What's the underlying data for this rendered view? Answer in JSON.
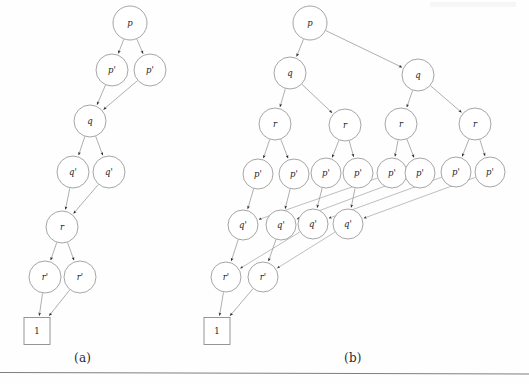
{
  "figure": {
    "background_color": "#fefefe",
    "node_stroke_color": "#8e8e8e",
    "edge_color": "#8c8c8c",
    "text_color": "#1d1d1d",
    "captions": [
      {
        "id": "a",
        "label": "(a)",
        "x": 74,
        "y": 351
      },
      {
        "id": "b",
        "label": "(b)",
        "x": 344,
        "y": 351
      }
    ],
    "separator_rule": {
      "x1": 0,
      "y1": 372,
      "x2": 529,
      "y2": 374
    }
  },
  "graph_a": {
    "name": "diagram-a",
    "nodes": [
      {
        "id": "a-p",
        "label": "p",
        "shape": "circle",
        "cx": 130,
        "cy": 23,
        "r": 17
      },
      {
        "id": "a-p1",
        "label": "p'",
        "shape": "circle",
        "cx": 112,
        "cy": 70,
        "r": 16
      },
      {
        "id": "a-p2",
        "label": "p'",
        "shape": "circle",
        "cx": 150,
        "cy": 70,
        "r": 16
      },
      {
        "id": "a-q",
        "label": "q",
        "shape": "circle",
        "cx": 90,
        "cy": 121,
        "r": 16
      },
      {
        "id": "a-q1",
        "label": "q'",
        "shape": "circle",
        "cx": 73,
        "cy": 172,
        "r": 16
      },
      {
        "id": "a-q2",
        "label": "q'",
        "shape": "circle",
        "cx": 109,
        "cy": 172,
        "r": 16
      },
      {
        "id": "a-r",
        "label": "r",
        "shape": "circle",
        "cx": 62,
        "cy": 227,
        "r": 16
      },
      {
        "id": "a-r1",
        "label": "r'",
        "shape": "circle",
        "cx": 45,
        "cy": 277,
        "r": 16
      },
      {
        "id": "a-r2",
        "label": "r'",
        "shape": "circle",
        "cx": 80,
        "cy": 277,
        "r": 16
      },
      {
        "id": "a-one",
        "label": "1",
        "shape": "box",
        "cx": 37,
        "cy": 331,
        "w": 26,
        "h": 27
      }
    ],
    "edges": [
      {
        "from": "a-p",
        "to": "a-p1"
      },
      {
        "from": "a-p",
        "to": "a-p2"
      },
      {
        "from": "a-p1",
        "to": "a-q"
      },
      {
        "from": "a-p2",
        "to": "a-q"
      },
      {
        "from": "a-q",
        "to": "a-q1"
      },
      {
        "from": "a-q",
        "to": "a-q2"
      },
      {
        "from": "a-q1",
        "to": "a-r"
      },
      {
        "from": "a-q2",
        "to": "a-r"
      },
      {
        "from": "a-r",
        "to": "a-r1"
      },
      {
        "from": "a-r",
        "to": "a-r2"
      },
      {
        "from": "a-r1",
        "to": "a-one"
      },
      {
        "from": "a-r2",
        "to": "a-one"
      }
    ]
  },
  "graph_b": {
    "name": "diagram-b",
    "nodes": [
      {
        "id": "b-p",
        "label": "p",
        "shape": "circle",
        "cx": 310,
        "cy": 23,
        "r": 17
      },
      {
        "id": "b-qL",
        "label": "q",
        "shape": "circle",
        "cx": 290,
        "cy": 73,
        "r": 16
      },
      {
        "id": "b-qR",
        "label": "q",
        "shape": "circle",
        "cx": 418,
        "cy": 75,
        "r": 16
      },
      {
        "id": "b-r1",
        "label": "r",
        "shape": "circle",
        "cx": 275,
        "cy": 124,
        "r": 16
      },
      {
        "id": "b-r2",
        "label": "r",
        "shape": "circle",
        "cx": 345,
        "cy": 125,
        "r": 16
      },
      {
        "id": "b-r3",
        "label": "r",
        "shape": "circle",
        "cx": 401,
        "cy": 124,
        "r": 16
      },
      {
        "id": "b-r4",
        "label": "r",
        "shape": "circle",
        "cx": 475,
        "cy": 124,
        "r": 16
      },
      {
        "id": "b-pp1",
        "label": "p'",
        "shape": "circle",
        "cx": 258,
        "cy": 174,
        "r": 15
      },
      {
        "id": "b-pp2",
        "label": "p'",
        "shape": "circle",
        "cx": 294,
        "cy": 174,
        "r": 15
      },
      {
        "id": "b-pp3",
        "label": "p'",
        "shape": "circle",
        "cx": 326,
        "cy": 173,
        "r": 15
      },
      {
        "id": "b-pp4",
        "label": "p'",
        "shape": "circle",
        "cx": 358,
        "cy": 173,
        "r": 15
      },
      {
        "id": "b-pp5",
        "label": "p'",
        "shape": "circle",
        "cx": 392,
        "cy": 173,
        "r": 15
      },
      {
        "id": "b-pp6",
        "label": "p'",
        "shape": "circle",
        "cx": 420,
        "cy": 173,
        "r": 15
      },
      {
        "id": "b-pp7",
        "label": "p'",
        "shape": "circle",
        "cx": 456,
        "cy": 172,
        "r": 15
      },
      {
        "id": "b-pp8",
        "label": "p'",
        "shape": "circle",
        "cx": 490,
        "cy": 172,
        "r": 15
      },
      {
        "id": "b-qp1",
        "label": "q'",
        "shape": "circle",
        "cx": 243,
        "cy": 225,
        "r": 15
      },
      {
        "id": "b-qp2",
        "label": "q'",
        "shape": "circle",
        "cx": 281,
        "cy": 225,
        "r": 15
      },
      {
        "id": "b-qp3",
        "label": "q'",
        "shape": "circle",
        "cx": 313,
        "cy": 224,
        "r": 15
      },
      {
        "id": "b-qp4",
        "label": "q'",
        "shape": "circle",
        "cx": 348,
        "cy": 224,
        "r": 15
      },
      {
        "id": "b-rp1",
        "label": "r'",
        "shape": "circle",
        "cx": 226,
        "cy": 277,
        "r": 15
      },
      {
        "id": "b-rp2",
        "label": "r'",
        "shape": "circle",
        "cx": 263,
        "cy": 277,
        "r": 15
      },
      {
        "id": "b-one",
        "label": "1",
        "shape": "box",
        "cx": 217,
        "cy": 331,
        "w": 26,
        "h": 27
      }
    ],
    "edges": [
      {
        "from": "b-p",
        "to": "b-qL"
      },
      {
        "from": "b-p",
        "to": "b-qR"
      },
      {
        "from": "b-qL",
        "to": "b-r1"
      },
      {
        "from": "b-qL",
        "to": "b-r2"
      },
      {
        "from": "b-qR",
        "to": "b-r3"
      },
      {
        "from": "b-qR",
        "to": "b-r4"
      },
      {
        "from": "b-r1",
        "to": "b-pp1"
      },
      {
        "from": "b-r1",
        "to": "b-pp2"
      },
      {
        "from": "b-r2",
        "to": "b-pp3"
      },
      {
        "from": "b-r2",
        "to": "b-pp4"
      },
      {
        "from": "b-r3",
        "to": "b-pp5"
      },
      {
        "from": "b-r3",
        "to": "b-pp6"
      },
      {
        "from": "b-r4",
        "to": "b-pp7"
      },
      {
        "from": "b-r4",
        "to": "b-pp8"
      },
      {
        "from": "b-pp1",
        "to": "b-qp1"
      },
      {
        "from": "b-pp2",
        "to": "b-qp2"
      },
      {
        "from": "b-pp3",
        "to": "b-qp3"
      },
      {
        "from": "b-pp4",
        "to": "b-qp4"
      },
      {
        "from": "b-pp5",
        "to": "b-qp1",
        "long": true
      },
      {
        "from": "b-pp6",
        "to": "b-qp2",
        "long": true
      },
      {
        "from": "b-pp7",
        "to": "b-qp3",
        "long": true
      },
      {
        "from": "b-pp8",
        "to": "b-qp4",
        "long": true
      },
      {
        "from": "b-qp1",
        "to": "b-rp1"
      },
      {
        "from": "b-qp2",
        "to": "b-rp2"
      },
      {
        "from": "b-qp3",
        "to": "b-rp1",
        "long": true
      },
      {
        "from": "b-qp4",
        "to": "b-rp2",
        "long": true
      },
      {
        "from": "b-rp1",
        "to": "b-one"
      },
      {
        "from": "b-rp2",
        "to": "b-one"
      }
    ]
  }
}
